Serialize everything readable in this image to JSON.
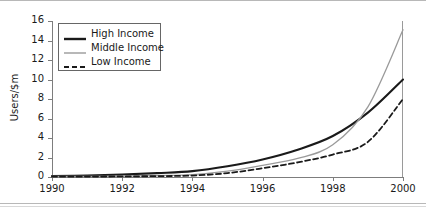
{
  "chart_data": {
    "type": "line",
    "title": "",
    "xlabel": "",
    "ylabel": "Users/$m",
    "xlim": [
      1990,
      2000
    ],
    "ylim": [
      0,
      16
    ],
    "grid": false,
    "legend_position": "top-left",
    "xticks": [
      1990,
      1992,
      1994,
      1996,
      1998,
      2000
    ],
    "xtick_labels": [
      "1990",
      "1992",
      "1994",
      "1996",
      "1998",
      "2000"
    ],
    "yticks": [
      0,
      2,
      4,
      6,
      8,
      10,
      12,
      14,
      16
    ],
    "ytick_labels": [
      "0",
      "2",
      "4",
      "6",
      "8",
      "10",
      "12",
      "14",
      "16"
    ],
    "x": [
      1990,
      1991,
      1992,
      1993,
      1994,
      1995,
      1996,
      1997,
      1998,
      1999,
      2000
    ],
    "series": [
      {
        "name": "High Income",
        "style": "solid",
        "color": "#1a1a1a",
        "width": 2.1,
        "values": [
          0.1,
          0.15,
          0.25,
          0.4,
          0.6,
          1.1,
          1.8,
          2.8,
          4.2,
          6.6,
          10.0
        ]
      },
      {
        "name": "Middle Income",
        "style": "solid",
        "color": "#9a9a9a",
        "width": 1.3,
        "values": [
          0.05,
          0.07,
          0.1,
          0.15,
          0.25,
          0.6,
          1.2,
          1.9,
          3.3,
          7.2,
          15.1
        ]
      },
      {
        "name": "Low Income",
        "style": "dashed",
        "color": "#1a1a1a",
        "width": 1.8,
        "values": [
          0.03,
          0.04,
          0.06,
          0.09,
          0.15,
          0.4,
          0.9,
          1.5,
          2.3,
          3.6,
          8.0
        ]
      }
    ],
    "annotations": []
  },
  "legend": {
    "entries": [
      {
        "label": "High Income"
      },
      {
        "label": "Middle Income"
      },
      {
        "label": "Low Income"
      }
    ]
  }
}
